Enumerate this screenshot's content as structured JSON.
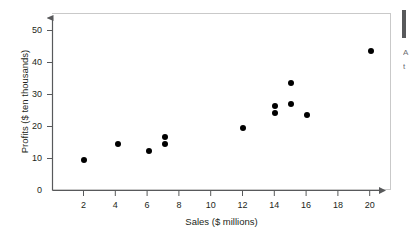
{
  "chart_data": {
    "type": "scatter",
    "title": "",
    "xlabel": "Sales ($ millions)",
    "ylabel": "Profits ($ ten thousands)",
    "xlim": [
      0,
      21.5
    ],
    "ylim": [
      0,
      55
    ],
    "xticks": [
      "2",
      "4",
      "6",
      "8",
      "10",
      "12",
      "14",
      "16",
      "18",
      "20"
    ],
    "xtick_values": [
      2,
      4,
      6,
      8,
      10,
      12,
      14,
      16,
      18,
      20
    ],
    "yticks": [
      "0",
      "10",
      "20",
      "30",
      "40",
      "50"
    ],
    "ytick_values": [
      0,
      10,
      20,
      30,
      40,
      50
    ],
    "grid": false,
    "legend": null,
    "marker_color": "#000000",
    "axis_color": "#58595b",
    "points": [
      {
        "x": 2.0,
        "y": 9.5
      },
      {
        "x": 4.1,
        "y": 14.6
      },
      {
        "x": 6.1,
        "y": 12.5
      },
      {
        "x": 7.1,
        "y": 16.8
      },
      {
        "x": 7.1,
        "y": 14.6
      },
      {
        "x": 12.0,
        "y": 19.5
      },
      {
        "x": 14.0,
        "y": 26.5
      },
      {
        "x": 14.0,
        "y": 24.3
      },
      {
        "x": 15.0,
        "y": 33.7
      },
      {
        "x": 15.0,
        "y": 27.0
      },
      {
        "x": 16.0,
        "y": 23.6
      },
      {
        "x": 20.0,
        "y": 43.5
      }
    ]
  },
  "margin_note": {
    "line1": "A",
    "line2": "t"
  }
}
